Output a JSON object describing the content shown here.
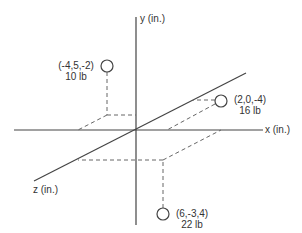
{
  "axes": {
    "x_label": "x (in.)",
    "y_label": "y (in.)",
    "z_label": "z (in.)"
  },
  "points": [
    {
      "coords": "(-4,5,-2)",
      "weight": "10 lb"
    },
    {
      "coords": "(2,0,-4)",
      "weight": "16 lb"
    },
    {
      "coords": "(6,-3,4)",
      "weight": "22 lb"
    }
  ],
  "colors": {
    "line": "#444444",
    "dash": "#666666",
    "background": "#ffffff"
  }
}
